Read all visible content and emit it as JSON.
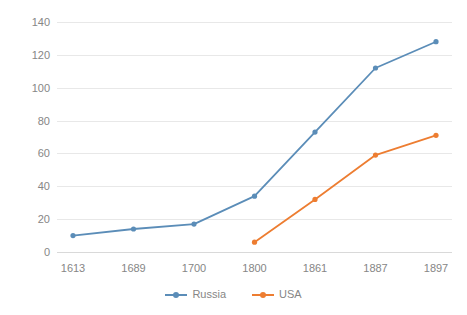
{
  "chart_data": {
    "type": "line",
    "title": "",
    "subtitle": "",
    "xlabel": "",
    "ylabel": "",
    "categories": [
      "1613",
      "1689",
      "1700",
      "1800",
      "1861",
      "1887",
      "1897"
    ],
    "series": [
      {
        "name": "Russia",
        "color": "#5B8DB8",
        "values": [
          10,
          14,
          17,
          34,
          73,
          112,
          128
        ]
      },
      {
        "name": "USA",
        "color": "#ED7D31",
        "values": [
          null,
          null,
          null,
          6,
          32,
          59,
          71
        ]
      }
    ],
    "ylim": [
      0,
      140
    ],
    "yticks": [
      "0",
      "20",
      "40",
      "60",
      "80",
      "100",
      "120",
      "140"
    ],
    "ytick_values": [
      0,
      20,
      40,
      60,
      80,
      100,
      120,
      140
    ],
    "grid": true,
    "grid_axis": "y",
    "legend_position": "bottom",
    "markers": true
  },
  "legend": {
    "items": [
      {
        "label": "Russia",
        "color": "#5B8DB8"
      },
      {
        "label": "USA",
        "color": "#ED7D31"
      }
    ]
  },
  "colors": {
    "russia": "#5B8DB8",
    "usa": "#ED7D31",
    "gridline": "#e8e8e8",
    "tick_text": "#868686",
    "background": "#ffffff"
  }
}
